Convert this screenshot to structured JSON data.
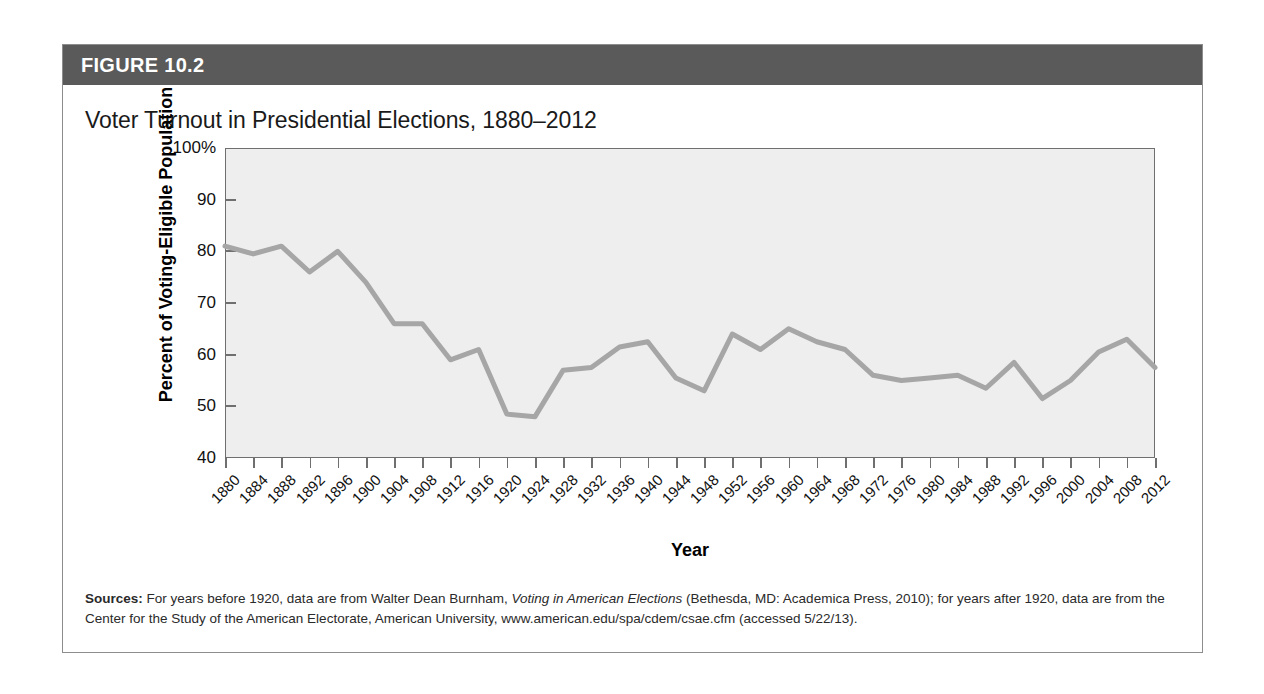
{
  "figure": {
    "number_label": "FIGURE 10.2",
    "title": "Voter Turnout in Presidential Elections, 1880–2012",
    "header_bg": "#5a5a5a",
    "plot_bg": "#eeeeee",
    "line_color": "#a6a6a6"
  },
  "source": {
    "label": "Sources:",
    "text_part1": " For years before 1920, data are from Walter Dean Burnham, ",
    "italic1": "Voting in American Elections",
    "text_part2": " (Bethesda, MD: Academica Press, 2010); for years after 1920, data are from the Center for the Study of the American Electorate, American University, www.american.edu/spa/cdem/csae.cfm (accessed 5/22/13)."
  },
  "chart_data": {
    "type": "line",
    "title": "Voter Turnout in Presidential Elections, 1880–2012",
    "xlabel": "Year",
    "ylabel": "Percent of Voting-Eligible Population",
    "xlim": [
      1880,
      2012
    ],
    "ylim": [
      40,
      100
    ],
    "grid": false,
    "legend": "none",
    "y_ticks": [
      40,
      50,
      60,
      70,
      80,
      90,
      100
    ],
    "y_tick_labels": [
      "40",
      "50",
      "60",
      "70",
      "80",
      "90",
      "100%"
    ],
    "x_ticks": [
      1880,
      1884,
      1888,
      1892,
      1896,
      1900,
      1904,
      1908,
      1912,
      1916,
      1920,
      1924,
      1928,
      1932,
      1936,
      1940,
      1944,
      1948,
      1952,
      1956,
      1960,
      1964,
      1968,
      1972,
      1976,
      1980,
      1984,
      1988,
      1992,
      1996,
      2000,
      2004,
      2008,
      2012
    ],
    "x": [
      1880,
      1884,
      1888,
      1892,
      1896,
      1900,
      1904,
      1908,
      1912,
      1916,
      1920,
      1924,
      1928,
      1932,
      1936,
      1940,
      1944,
      1948,
      1952,
      1956,
      1960,
      1964,
      1968,
      1972,
      1976,
      1980,
      1984,
      1988,
      1992,
      1996,
      2000,
      2004,
      2008,
      2012
    ],
    "values": [
      81.0,
      79.5,
      81.0,
      76.0,
      80.0,
      74.0,
      66.0,
      66.0,
      59.0,
      61.0,
      48.5,
      48.0,
      57.0,
      57.5,
      61.5,
      62.5,
      55.5,
      53.0,
      64.0,
      61.0,
      65.0,
      62.5,
      61.0,
      56.0,
      55.0,
      55.5,
      56.0,
      53.5,
      58.5,
      51.5,
      55.0,
      60.5,
      63.0,
      57.5
    ],
    "series": [
      {
        "name": "Voter turnout",
        "values": [
          81.0,
          79.5,
          81.0,
          76.0,
          80.0,
          74.0,
          66.0,
          66.0,
          59.0,
          61.0,
          48.5,
          48.0,
          57.0,
          57.5,
          61.5,
          62.5,
          55.5,
          53.0,
          64.0,
          61.0,
          65.0,
          62.5,
          61.0,
          56.0,
          55.0,
          55.5,
          56.0,
          53.5,
          58.5,
          51.5,
          55.0,
          60.5,
          63.0,
          57.5
        ]
      }
    ]
  }
}
